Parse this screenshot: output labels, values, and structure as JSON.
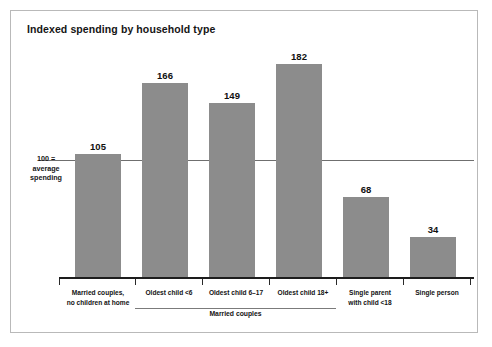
{
  "figure": {
    "title": "Indexed spending by household type",
    "reference_label_lines": [
      "100 =",
      "average",
      "spending"
    ],
    "group_bracket_label": "Married couples"
  },
  "chart_data": {
    "type": "bar",
    "title": "Indexed spending by household type",
    "xlabel": "",
    "ylabel": "",
    "ylim": [
      0,
      200
    ],
    "grid": false,
    "legend": "none",
    "reference_line": {
      "value": 100,
      "label": "100 = average spending"
    },
    "bar_color": "#8c8c8c",
    "categories": [
      "Married couples, no children at home",
      "Oldest child <6",
      "Oldest child 6–17",
      "Oldest child 18+",
      "Single parent with child <18",
      "Single person"
    ],
    "category_label_lines": [
      [
        "Married couples,",
        "no children at home"
      ],
      [
        "Oldest child <6"
      ],
      [
        "Oldest child 6–17"
      ],
      [
        "Oldest child 18+"
      ],
      [
        "Single parent",
        "with child <18"
      ],
      [
        "Single person"
      ]
    ],
    "values": [
      105,
      166,
      149,
      182,
      68,
      34
    ],
    "value_labels": [
      "105",
      "166",
      "149",
      "182",
      "68",
      "34"
    ],
    "groups": [
      {
        "label": "Married couples",
        "category_indices": [
          1,
          2,
          3
        ]
      }
    ]
  }
}
